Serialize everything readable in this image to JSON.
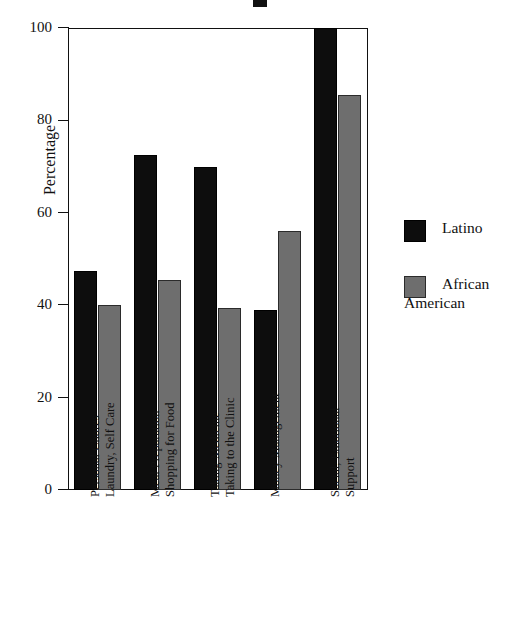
{
  "chart_data": {
    "type": "bar",
    "title": "",
    "xlabel": "",
    "ylabel": "Percentage",
    "ylim": [
      0,
      100
    ],
    "yticks": [
      "0",
      "20",
      "40",
      "60",
      "80",
      "100"
    ],
    "grid": false,
    "legend_position": "right",
    "categories": [
      "Personal Chores\nLaundry, Self Care",
      "Meal Preparation\nShopping for Food",
      "Taking Medicine\nTaking to the Clinic",
      "Money Management",
      "Social, Emotional\nSupport"
    ],
    "category_lines": [
      [
        "Personal Chores",
        "Laundry, Self Care"
      ],
      [
        "Meal Preparation",
        "Shopping for Food"
      ],
      [
        "Taking Medicine",
        "Taking to the Clinic"
      ],
      [
        "Money Management"
      ],
      [
        "Social, Emotional",
        "Support"
      ]
    ],
    "series": [
      {
        "name": "Latino",
        "color": "#0d0d0d",
        "values": [
          47.5,
          72.5,
          70,
          39,
          100
        ]
      },
      {
        "name": "African American",
        "color": "#6e6e6e",
        "values": [
          40,
          45.5,
          39.5,
          56,
          85.5
        ]
      }
    ]
  },
  "legend": {
    "items": [
      {
        "label": "Latino",
        "color": "#0d0d0d"
      },
      {
        "label": "African American",
        "label_line1": "African",
        "label_line2": "American",
        "color": "#6e6e6e"
      }
    ]
  },
  "axis": {
    "y_title": "Percentage",
    "ticks": [
      "0",
      "20",
      "40",
      "60",
      "80",
      "100"
    ]
  }
}
